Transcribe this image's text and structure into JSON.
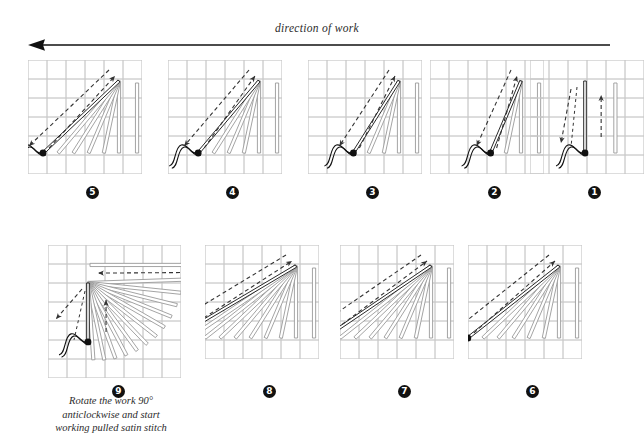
{
  "header": {
    "direction_label": "direction of work",
    "arrow_icon": "left-arrow-icon",
    "arrow_direction": "left"
  },
  "colors": {
    "grid": "#c9c9c9",
    "frame": "#bdbdbd",
    "stitch_done": "#9a9a9a",
    "stitch_active": "#111111",
    "dashed_guide": "#333333",
    "background": "#ffffff",
    "badge_bg": "#111111",
    "badge_text": "#ffffff"
  },
  "caption": {
    "line1": "Rotate the work 90°",
    "line2": "anticlockwise and start",
    "line3": "working pulled satin stitch"
  },
  "panels": [
    {
      "id": "panel-5",
      "number": "5",
      "badge_glyph": "5",
      "row": 1,
      "order_in_row": 1,
      "grid_cols": 6,
      "grid_rows": 6,
      "description": "fifth stitch of fan, five completed stitches",
      "completed_stitches": 5,
      "active_stitch_angle": "diagonal-45"
    },
    {
      "id": "panel-4",
      "number": "4",
      "badge_glyph": "4",
      "row": 1,
      "order_in_row": 2,
      "grid_cols": 6,
      "grid_rows": 6,
      "description": "fourth stitch of fan, four completed stitches",
      "completed_stitches": 4,
      "active_stitch_angle": "diagonal-50"
    },
    {
      "id": "panel-3",
      "number": "3",
      "badge_glyph": "3",
      "row": 1,
      "order_in_row": 3,
      "grid_cols": 6,
      "grid_rows": 6,
      "description": "third stitch of fan, three completed stitches",
      "completed_stitches": 3,
      "active_stitch_angle": "diagonal-60"
    },
    {
      "id": "panel-2",
      "number": "2",
      "badge_glyph": "2",
      "row": 1,
      "order_in_row": 4,
      "grid_cols": 6,
      "grid_rows": 6,
      "description": "second stitch of fan, two completed stitches",
      "completed_stitches": 2,
      "active_stitch_angle": "diagonal-75"
    },
    {
      "id": "panel-1",
      "number": "1",
      "badge_glyph": "1",
      "row": 1,
      "order_in_row": 5,
      "grid_cols": 6,
      "grid_rows": 6,
      "description": "first stitch, vertical, one completed stitch",
      "completed_stitches": 1,
      "active_stitch_angle": "vertical"
    },
    {
      "id": "panel-9",
      "number": "9",
      "badge_glyph": "9",
      "row": 2,
      "order_in_row": 1,
      "grid_cols": 7,
      "grid_rows": 7,
      "description": "work rotated, full fan radiating from upper-left apex",
      "completed_stitches": 12,
      "active_stitch_angle": "vertical-rotated"
    },
    {
      "id": "panel-8",
      "number": "8",
      "badge_glyph": "8",
      "row": 2,
      "order_in_row": 2,
      "grid_cols": 6,
      "grid_rows": 6,
      "description": "eighth stitch, almost horizontal",
      "completed_stitches": 8,
      "active_stitch_angle": "near-horizontal"
    },
    {
      "id": "panel-7",
      "number": "7",
      "badge_glyph": "7",
      "row": 2,
      "order_in_row": 3,
      "grid_cols": 6,
      "grid_rows": 6,
      "description": "seventh stitch, shallow diagonal",
      "completed_stitches": 7,
      "active_stitch_angle": "diagonal-25"
    },
    {
      "id": "panel-6",
      "number": "6",
      "badge_glyph": "6",
      "row": 2,
      "order_in_row": 4,
      "grid_cols": 6,
      "grid_rows": 6,
      "description": "sixth stitch, diagonal",
      "completed_stitches": 6,
      "active_stitch_angle": "diagonal-35"
    }
  ]
}
